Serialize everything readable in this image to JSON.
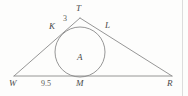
{
  "figure": {
    "type": "geometry-diagram",
    "background_color": "#fdfdfc",
    "stroke_color": "#8a8a8a",
    "label_color": "#4a4a4a",
    "triangle": {
      "name": "WTR",
      "vertices": [
        {
          "label": "W",
          "x": 14,
          "y": 76
        },
        {
          "label": "T",
          "x": 80,
          "y": 18
        },
        {
          "label": "R",
          "x": 172,
          "y": 76
        }
      ]
    },
    "incircle": {
      "center_label": "A",
      "cx": 80,
      "cy": 52,
      "r": 25
    },
    "tangent_points": [
      {
        "label": "K",
        "on_side": "WT",
        "x": 61,
        "y": 33
      },
      {
        "label": "L",
        "on_side": "TR",
        "x": 101,
        "y": 31
      },
      {
        "label": "M",
        "on_side": "WR",
        "x": 80,
        "y": 77
      }
    ],
    "labels": [
      {
        "name": "vertex-label-T",
        "text": "T",
        "x": 76,
        "y": 4
      },
      {
        "name": "tangent-label-K",
        "text": "K",
        "x": 49,
        "y": 22
      },
      {
        "name": "tangent-label-L",
        "text": "L",
        "x": 105,
        "y": 21
      },
      {
        "name": "center-label-A",
        "text": "A",
        "x": 77,
        "y": 53
      },
      {
        "name": "vertex-label-W",
        "text": "W",
        "x": 9,
        "y": 79
      },
      {
        "name": "tangent-label-M",
        "text": "M",
        "x": 76,
        "y": 79
      },
      {
        "name": "vertex-label-R",
        "text": "R",
        "x": 167,
        "y": 79
      }
    ],
    "measurements": [
      {
        "name": "measure-TK",
        "text": "3",
        "x": 63,
        "y": 15,
        "segment": "KT"
      },
      {
        "name": "measure-WM",
        "text": "9.5",
        "x": 41,
        "y": 80,
        "segment": "WM"
      }
    ],
    "right_rule": {
      "name": "page-edge-rule",
      "x": 182,
      "color": "#dcdcdc"
    }
  }
}
